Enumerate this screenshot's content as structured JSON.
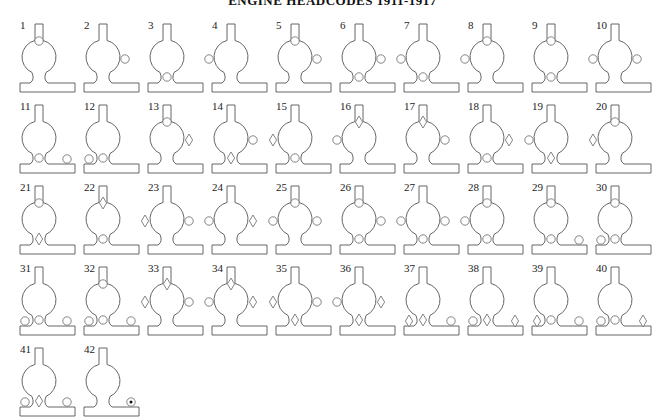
{
  "title": "ENGINE HEADCODES 1911-1917",
  "layout": {
    "columns": 10,
    "col_pitch": 64,
    "row_pitch": 81,
    "origin_x": 20,
    "origin_y": 20
  },
  "legend": {
    "c": "lamp (circle)",
    "d": "diamond disc",
    "dot": "lamp with dot"
  },
  "positions": [
    "top",
    "left",
    "right",
    "center",
    "bl",
    "br"
  ],
  "headcodes": [
    {
      "n": "1",
      "marks": [
        [
          "top",
          "c"
        ]
      ]
    },
    {
      "n": "2",
      "marks": [
        [
          "right",
          "c"
        ]
      ]
    },
    {
      "n": "3",
      "marks": [
        [
          "center",
          "c"
        ]
      ]
    },
    {
      "n": "4",
      "marks": [
        [
          "left",
          "c"
        ]
      ]
    },
    {
      "n": "5",
      "marks": [
        [
          "top",
          "c"
        ],
        [
          "right",
          "c"
        ]
      ]
    },
    {
      "n": "6",
      "marks": [
        [
          "right",
          "c"
        ],
        [
          "center",
          "c"
        ]
      ]
    },
    {
      "n": "7",
      "marks": [
        [
          "left",
          "c"
        ],
        [
          "center",
          "c"
        ]
      ]
    },
    {
      "n": "8",
      "marks": [
        [
          "top",
          "c"
        ],
        [
          "left",
          "c"
        ]
      ]
    },
    {
      "n": "9",
      "marks": [
        [
          "top",
          "c"
        ],
        [
          "center",
          "c"
        ]
      ]
    },
    {
      "n": "10",
      "marks": [
        [
          "left",
          "c"
        ],
        [
          "right",
          "c"
        ]
      ]
    },
    {
      "n": "11",
      "marks": [
        [
          "center",
          "c"
        ],
        [
          "br",
          "c"
        ]
      ]
    },
    {
      "n": "12",
      "marks": [
        [
          "bl",
          "c"
        ],
        [
          "center",
          "c"
        ]
      ]
    },
    {
      "n": "13",
      "marks": [
        [
          "top",
          "c"
        ],
        [
          "right",
          "d"
        ]
      ]
    },
    {
      "n": "14",
      "marks": [
        [
          "right",
          "c"
        ],
        [
          "center",
          "d"
        ]
      ]
    },
    {
      "n": "15",
      "marks": [
        [
          "left",
          "d"
        ],
        [
          "center",
          "c"
        ]
      ]
    },
    {
      "n": "16",
      "marks": [
        [
          "top",
          "d"
        ],
        [
          "left",
          "c"
        ]
      ]
    },
    {
      "n": "17",
      "marks": [
        [
          "top",
          "d"
        ],
        [
          "right",
          "c"
        ]
      ]
    },
    {
      "n": "18",
      "marks": [
        [
          "right",
          "d"
        ],
        [
          "center",
          "c"
        ]
      ]
    },
    {
      "n": "19",
      "marks": [
        [
          "left",
          "c"
        ],
        [
          "center",
          "d"
        ]
      ]
    },
    {
      "n": "20",
      "marks": [
        [
          "top",
          "c"
        ],
        [
          "left",
          "d"
        ]
      ]
    },
    {
      "n": "21",
      "marks": [
        [
          "top",
          "c"
        ],
        [
          "center",
          "d"
        ]
      ]
    },
    {
      "n": "22",
      "marks": [
        [
          "top",
          "d"
        ],
        [
          "center",
          "c"
        ]
      ]
    },
    {
      "n": "23",
      "marks": [
        [
          "left",
          "d"
        ],
        [
          "right",
          "c"
        ]
      ]
    },
    {
      "n": "24",
      "marks": [
        [
          "left",
          "c"
        ],
        [
          "right",
          "d"
        ]
      ]
    },
    {
      "n": "25",
      "marks": [
        [
          "top",
          "c"
        ],
        [
          "left",
          "c"
        ],
        [
          "right",
          "c"
        ]
      ]
    },
    {
      "n": "26",
      "marks": [
        [
          "top",
          "c"
        ],
        [
          "right",
          "c"
        ],
        [
          "center",
          "c"
        ]
      ]
    },
    {
      "n": "27",
      "marks": [
        [
          "left",
          "c"
        ],
        [
          "right",
          "c"
        ],
        [
          "center",
          "c"
        ]
      ]
    },
    {
      "n": "28",
      "marks": [
        [
          "top",
          "c"
        ],
        [
          "left",
          "c"
        ],
        [
          "center",
          "c"
        ]
      ]
    },
    {
      "n": "29",
      "marks": [
        [
          "top",
          "c"
        ],
        [
          "center",
          "c"
        ],
        [
          "br",
          "c"
        ]
      ]
    },
    {
      "n": "30",
      "marks": [
        [
          "top",
          "c"
        ],
        [
          "bl",
          "c"
        ],
        [
          "center",
          "c"
        ]
      ]
    },
    {
      "n": "31",
      "marks": [
        [
          "bl",
          "c"
        ],
        [
          "center",
          "c"
        ],
        [
          "br",
          "c"
        ]
      ]
    },
    {
      "n": "32",
      "marks": [
        [
          "top",
          "c"
        ],
        [
          "bl",
          "c"
        ],
        [
          "center",
          "c"
        ],
        [
          "br",
          "c"
        ]
      ]
    },
    {
      "n": "33",
      "marks": [
        [
          "top",
          "d"
        ],
        [
          "left",
          "d"
        ],
        [
          "right",
          "c"
        ]
      ]
    },
    {
      "n": "34",
      "marks": [
        [
          "top",
          "d"
        ],
        [
          "left",
          "c"
        ],
        [
          "right",
          "d"
        ]
      ]
    },
    {
      "n": "35",
      "marks": [
        [
          "left",
          "d"
        ],
        [
          "right",
          "c"
        ],
        [
          "center",
          "d"
        ]
      ]
    },
    {
      "n": "36",
      "marks": [
        [
          "left",
          "c"
        ],
        [
          "right",
          "d"
        ],
        [
          "center",
          "d"
        ]
      ]
    },
    {
      "n": "37",
      "marks": [
        [
          "bl",
          "d"
        ],
        [
          "center",
          "d"
        ],
        [
          "br",
          "c"
        ]
      ]
    },
    {
      "n": "38",
      "marks": [
        [
          "bl",
          "c"
        ],
        [
          "center",
          "d"
        ],
        [
          "br",
          "d"
        ]
      ]
    },
    {
      "n": "39",
      "marks": [
        [
          "bl",
          "d"
        ],
        [
          "center",
          "c"
        ],
        [
          "br",
          "c"
        ]
      ]
    },
    {
      "n": "40",
      "marks": [
        [
          "bl",
          "c"
        ],
        [
          "center",
          "c"
        ],
        [
          "br",
          "d"
        ]
      ]
    },
    {
      "n": "41",
      "marks": [
        [
          "bl",
          "c"
        ],
        [
          "center",
          "d"
        ],
        [
          "br",
          "c"
        ]
      ]
    },
    {
      "n": "42",
      "marks": [
        [
          "br",
          "dot"
        ]
      ]
    }
  ],
  "colors": {
    "line": "#555555",
    "lamp": "#777777",
    "dot": "#111111",
    "background": "#ffffff"
  }
}
